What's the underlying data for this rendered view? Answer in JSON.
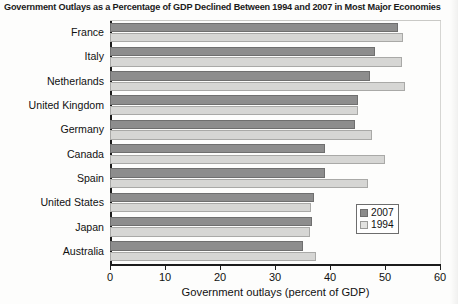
{
  "chart_data": {
    "type": "bar",
    "orientation": "horizontal",
    "title": "Government Outlays as a Percentage of GDP Declined Between 1994 and 2007 in Most Major Economies",
    "xlabel": "Government outlays (percent of GDP)",
    "ylabel": "",
    "xlim": [
      0,
      60
    ],
    "xticks": [
      0,
      10,
      20,
      30,
      40,
      50,
      60
    ],
    "grid": false,
    "legend_position": "lower-right-inside",
    "categories": [
      "France",
      "Italy",
      "Netherlands",
      "United Kingdom",
      "Germany",
      "Canada",
      "Spain",
      "United States",
      "Japan",
      "Australia"
    ],
    "series": [
      {
        "name": "2007",
        "color": "#8d8d8d",
        "values": [
          52.4,
          48.2,
          47.3,
          45.1,
          44.6,
          39.1,
          39.1,
          37.0,
          36.7,
          35.1
        ]
      },
      {
        "name": "1994",
        "color": "#d6d6d4",
        "values": [
          53.3,
          53.1,
          53.6,
          45.0,
          47.7,
          50.0,
          46.9,
          36.6,
          36.4,
          37.5
        ]
      }
    ]
  },
  "legend": {
    "entries": [
      {
        "label": "2007"
      },
      {
        "label": "1994"
      }
    ]
  }
}
